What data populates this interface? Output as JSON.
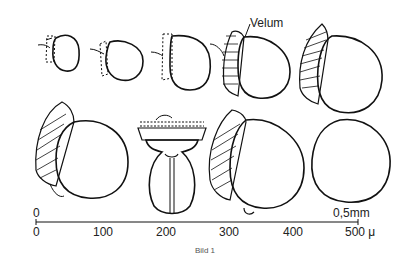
{
  "figure": {
    "annotation": "Velum",
    "scale": {
      "top_zero": "0",
      "top_end": "0,5mm",
      "ticks": [
        "0",
        "100",
        "200",
        "300",
        "400",
        "500 μ"
      ]
    },
    "caption": "Bild 1"
  }
}
